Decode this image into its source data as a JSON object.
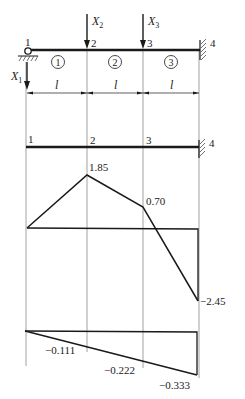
{
  "structure": {
    "nodes": [
      "1",
      "2",
      "3",
      "4"
    ],
    "elements": [
      "1",
      "2",
      "3"
    ],
    "loads": {
      "x1": "X",
      "x1_sub": "1",
      "x2": "X",
      "x2_sub": "2",
      "x3": "X",
      "x3_sub": "3"
    },
    "span_label": "l",
    "supports": {
      "left": "pin",
      "right": "fixed"
    }
  },
  "diagram_top": {
    "node_labels": [
      "1",
      "2",
      "3",
      "4"
    ],
    "values": {
      "n1": "0",
      "n2": "1.85",
      "n3": "0.70",
      "n4": "-2.45"
    },
    "labels": {
      "n2": "1.85",
      "n3": "0.70",
      "n4": "−2.45"
    }
  },
  "diagram_bottom": {
    "values": {
      "n1": "0",
      "n2": "-0.111",
      "n3": "-0.222",
      "n4": "-0.333"
    },
    "labels": {
      "n2": "−0.111",
      "n3": "−0.222",
      "n4": "−0.333"
    }
  },
  "colors": {
    "line": "#1a1a1a",
    "grid": "#777777"
  }
}
